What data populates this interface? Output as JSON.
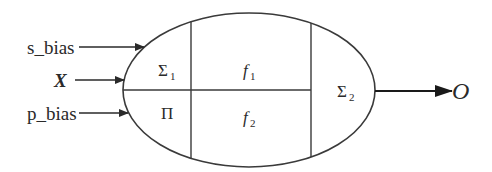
{
  "diagram": {
    "inputs": [
      {
        "id": "s_bias",
        "label": "s_bias",
        "italic": false
      },
      {
        "id": "x",
        "label": "X",
        "italic": true,
        "bold": true
      },
      {
        "id": "p_bias",
        "label": "p_bias",
        "italic": false
      }
    ],
    "cells": {
      "sigma1": {
        "symbol": "Σ",
        "subscript": "1"
      },
      "f1": {
        "symbol": "f",
        "subscript": "1"
      },
      "pi": {
        "symbol": "Π",
        "subscript": ""
      },
      "f2": {
        "symbol": "f",
        "subscript": "2"
      },
      "sigma2": {
        "symbol": "Σ",
        "subscript": "2"
      }
    },
    "output": {
      "label": "O"
    },
    "colors": {
      "stroke": "#3a3a3a",
      "text": "#2a2a2a",
      "background": "#ffffff"
    }
  }
}
